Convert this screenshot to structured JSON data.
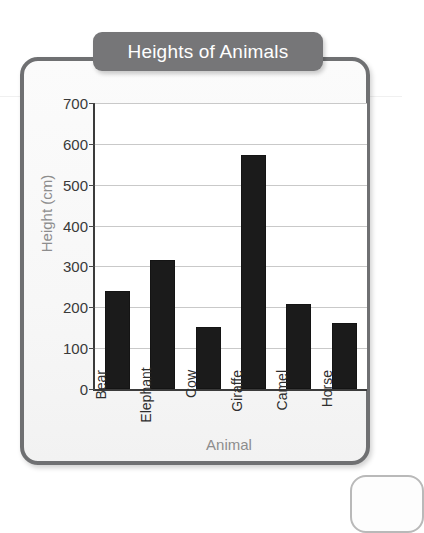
{
  "chart_data": {
    "type": "bar",
    "title": "Heights of Animals",
    "xlabel": "Animal",
    "ylabel": "Height (cm)",
    "categories": [
      "Bear",
      "Elephant",
      "Cow",
      "Giraffe",
      "Camel",
      "Horse"
    ],
    "values": [
      240,
      315,
      152,
      573,
      208,
      161
    ],
    "ylim": [
      0,
      700
    ],
    "ytick_step": 100,
    "yticks": [
      0,
      100,
      200,
      300,
      400,
      500,
      600,
      700
    ],
    "ytick_labels": [
      "0",
      "100",
      "200",
      "300",
      "400",
      "500",
      "600",
      "700"
    ],
    "grid": true,
    "grid_axis": "y",
    "legend": false,
    "legend_position": "none",
    "bar_color": "#1b1b1b",
    "gridline_color": "#c9c9c9",
    "axis_color": "#3b3b3b",
    "xtick_rotation": 90
  },
  "frame": {
    "border_color": "#6f7072",
    "background_color": "#f7f7f7"
  },
  "title_banner": {
    "text": "Heights of Animals",
    "background_color": "#767678",
    "text_color": "#ffffff"
  },
  "axis_label_color": "#8d8d8d"
}
